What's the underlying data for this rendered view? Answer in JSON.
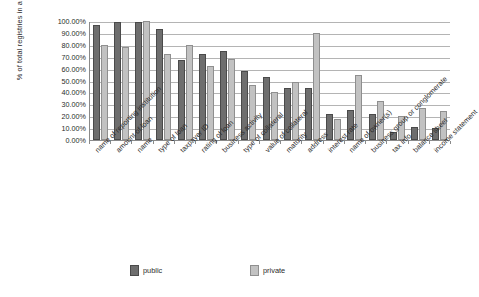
{
  "chart_data": {
    "type": "bar",
    "title": "",
    "xlabel": "",
    "ylabel": "% of total registries in a category",
    "ylim": [
      0,
      100
    ],
    "ytick_labels": [
      "100.00%",
      "90.00%",
      "80.00%",
      "70.00%",
      "60.00%",
      "50.00%",
      "40.00%",
      "30.00%",
      "20.00%",
      "10.00%",
      "0.00%"
    ],
    "ytick_values": [
      100,
      90,
      80,
      70,
      60,
      50,
      40,
      30,
      20,
      10,
      0
    ],
    "grid": true,
    "legend_position": "bottom",
    "categories": [
      "name of reporting institution",
      "amount of loan",
      "name",
      "type of loan",
      "taxpayer ID",
      "rating of loan",
      "business activity",
      "type of collateral",
      "value of collateral",
      "maturity",
      "address",
      "interest rate",
      "name of owner(s)",
      "business group or conglomerate",
      "tax info",
      "balance sheet",
      "income statement"
    ],
    "series": [
      {
        "name": "public",
        "color": "#6e6e6e",
        "values": [
          97,
          99,
          99,
          93,
          67,
          72,
          75,
          58,
          53,
          44,
          44,
          22,
          25,
          22,
          7,
          11,
          10
        ]
      },
      {
        "name": "private",
        "color": "#c2c2c2",
        "values": [
          80,
          78,
          100,
          72,
          80,
          62,
          68,
          46,
          40,
          49,
          90,
          18,
          55,
          33,
          20,
          27,
          24
        ]
      }
    ]
  },
  "legend": {
    "items": [
      {
        "label": "public"
      },
      {
        "label": "private"
      }
    ]
  }
}
